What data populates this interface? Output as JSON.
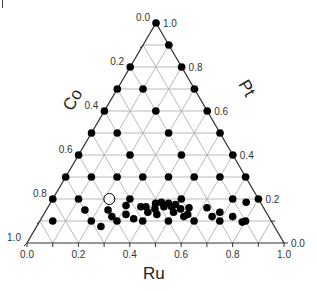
{
  "chart_data": {
    "type": "scatter",
    "subtype": "ternary",
    "title": "",
    "axes": {
      "bottom": {
        "label": "Ru",
        "ticks": [
          "0.0",
          "0.2",
          "0.4",
          "0.6",
          "0.8",
          "1.0"
        ]
      },
      "right": {
        "label": "Pt",
        "ticks": [
          "0.0",
          "0.2",
          "0.4",
          "0.6",
          "0.8",
          "1.0"
        ]
      },
      "left": {
        "label": "Co",
        "ticks": [
          "0.0",
          "0.2",
          "0.4",
          "0.6",
          "0.8",
          "1.0"
        ]
      }
    },
    "grid": true,
    "grid_step": 0.1,
    "series": [
      {
        "name": "filled",
        "marker": "filled-circle",
        "color": "#000000",
        "points": [
          {
            "Ru": 0.0,
            "Pt": 1.0,
            "Co": 0.0
          },
          {
            "Ru": 0.0,
            "Pt": 0.8,
            "Co": 0.2
          },
          {
            "Ru": 0.0,
            "Pt": 0.6,
            "Co": 0.4
          },
          {
            "Ru": 0.0,
            "Pt": 0.4,
            "Co": 0.6
          },
          {
            "Ru": 0.0,
            "Pt": 0.3,
            "Co": 0.7
          },
          {
            "Ru": 0.0,
            "Pt": 0.2,
            "Co": 0.8
          },
          {
            "Ru": 0.0,
            "Pt": 0.5,
            "Co": 0.5
          },
          {
            "Ru": 0.0,
            "Pt": 0.7,
            "Co": 0.3
          },
          {
            "Ru": 0.1,
            "Pt": 0.9,
            "Co": 0.0
          },
          {
            "Ru": 0.2,
            "Pt": 0.8,
            "Co": 0.0
          },
          {
            "Ru": 0.3,
            "Pt": 0.7,
            "Co": 0.0
          },
          {
            "Ru": 0.4,
            "Pt": 0.6,
            "Co": 0.0
          },
          {
            "Ru": 0.5,
            "Pt": 0.5,
            "Co": 0.0
          },
          {
            "Ru": 0.6,
            "Pt": 0.4,
            "Co": 0.0
          },
          {
            "Ru": 0.7,
            "Pt": 0.3,
            "Co": 0.0
          },
          {
            "Ru": 0.8,
            "Pt": 0.2,
            "Co": 0.0
          },
          {
            "Ru": 0.1,
            "Pt": 0.7,
            "Co": 0.2
          },
          {
            "Ru": 0.2,
            "Pt": 0.6,
            "Co": 0.2
          },
          {
            "Ru": 0.1,
            "Pt": 0.5,
            "Co": 0.4
          },
          {
            "Ru": 0.3,
            "Pt": 0.5,
            "Co": 0.2
          },
          {
            "Ru": 0.2,
            "Pt": 0.4,
            "Co": 0.4
          },
          {
            "Ru": 0.4,
            "Pt": 0.4,
            "Co": 0.2
          },
          {
            "Ru": 0.1,
            "Pt": 0.3,
            "Co": 0.6
          },
          {
            "Ru": 0.2,
            "Pt": 0.3,
            "Co": 0.5
          },
          {
            "Ru": 0.3,
            "Pt": 0.3,
            "Co": 0.4
          },
          {
            "Ru": 0.4,
            "Pt": 0.3,
            "Co": 0.3
          },
          {
            "Ru": 0.5,
            "Pt": 0.3,
            "Co": 0.2
          },
          {
            "Ru": 0.6,
            "Pt": 0.3,
            "Co": 0.1
          },
          {
            "Ru": 0.1,
            "Pt": 0.2,
            "Co": 0.7
          },
          {
            "Ru": 0.3,
            "Pt": 0.2,
            "Co": 0.5
          },
          {
            "Ru": 0.5,
            "Pt": 0.2,
            "Co": 0.3
          },
          {
            "Ru": 0.7,
            "Pt": 0.2,
            "Co": 0.1
          },
          {
            "Ru": 0.05,
            "Pt": 0.1,
            "Co": 0.85
          },
          {
            "Ru": 0.2,
            "Pt": 0.1,
            "Co": 0.7
          },
          {
            "Ru": 0.15,
            "Pt": 0.15,
            "Co": 0.7
          },
          {
            "Ru": 0.3,
            "Pt": 0.17,
            "Co": 0.53
          },
          {
            "Ru": 0.3,
            "Pt": 0.1,
            "Co": 0.6
          },
          {
            "Ru": 0.4,
            "Pt": 0.1,
            "Co": 0.5
          },
          {
            "Ru": 0.5,
            "Pt": 0.1,
            "Co": 0.4
          },
          {
            "Ru": 0.6,
            "Pt": 0.1,
            "Co": 0.3
          },
          {
            "Ru": 0.7,
            "Pt": 0.1,
            "Co": 0.2
          },
          {
            "Ru": 0.8,
            "Pt": 0.1,
            "Co": 0.1
          },
          {
            "Ru": 0.24,
            "Pt": 0.15,
            "Co": 0.61
          },
          {
            "Ru": 0.27,
            "Pt": 0.12,
            "Co": 0.61
          },
          {
            "Ru": 0.32,
            "Pt": 0.13,
            "Co": 0.55
          },
          {
            "Ru": 0.36,
            "Pt": 0.11,
            "Co": 0.53
          },
          {
            "Ru": 0.36,
            "Pt": 0.165,
            "Co": 0.475
          },
          {
            "Ru": 0.38,
            "Pt": 0.165,
            "Co": 0.455
          },
          {
            "Ru": 0.4,
            "Pt": 0.14,
            "Co": 0.46
          },
          {
            "Ru": 0.41,
            "Pt": 0.18,
            "Co": 0.41
          },
          {
            "Ru": 0.42,
            "Pt": 0.155,
            "Co": 0.425
          },
          {
            "Ru": 0.43,
            "Pt": 0.185,
            "Co": 0.385
          },
          {
            "Ru": 0.44,
            "Pt": 0.13,
            "Co": 0.43
          },
          {
            "Ru": 0.45,
            "Pt": 0.165,
            "Co": 0.385
          },
          {
            "Ru": 0.46,
            "Pt": 0.18,
            "Co": 0.36
          },
          {
            "Ru": 0.48,
            "Pt": 0.165,
            "Co": 0.355
          },
          {
            "Ru": 0.49,
            "Pt": 0.175,
            "Co": 0.335
          },
          {
            "Ru": 0.5,
            "Pt": 0.14,
            "Co": 0.36
          },
          {
            "Ru": 0.52,
            "Pt": 0.155,
            "Co": 0.325
          },
          {
            "Ru": 0.55,
            "Pt": 0.12,
            "Co": 0.33
          },
          {
            "Ru": 0.56,
            "Pt": 0.13,
            "Co": 0.31
          },
          {
            "Ru": 0.55,
            "Pt": 0.16,
            "Co": 0.29
          },
          {
            "Ru": 0.62,
            "Pt": 0.16,
            "Co": 0.22
          },
          {
            "Ru": 0.68,
            "Pt": 0.14,
            "Co": 0.18
          },
          {
            "Ru": 0.66,
            "Pt": 0.12,
            "Co": 0.22
          },
          {
            "Ru": 0.76,
            "Pt": 0.185,
            "Co": 0.055
          },
          {
            "Ru": 0.74,
            "Pt": 0.12,
            "Co": 0.14
          },
          {
            "Ru": 0.79,
            "Pt": 0.095,
            "Co": 0.115
          },
          {
            "Ru": 0.25,
            "Pt": 0.075,
            "Co": 0.675
          }
        ]
      },
      {
        "name": "open",
        "marker": "open-circle",
        "color": "#000000",
        "points": [
          {
            "Ru": 0.22,
            "Pt": 0.2,
            "Co": 0.58
          }
        ]
      }
    ]
  },
  "labels": {
    "ru_axis": "Ru",
    "pt_axis": "Pt",
    "co_axis": "Co",
    "bottom_ticks": [
      "0.0",
      "0.2",
      "0.4",
      "0.6",
      "0.8",
      "1.0"
    ],
    "right_ticks": [
      "0.0",
      "0.2",
      "0.4",
      "0.6",
      "0.8",
      "1.0"
    ],
    "left_ticks": [
      "1.0",
      "0.8",
      "0.6",
      "0.4",
      "0.2",
      "0.0"
    ]
  },
  "pixel_points": {
    "filled": [
      [
        156,
        24
      ],
      [
        143,
        47
      ],
      [
        130,
        71
      ],
      [
        117,
        94
      ],
      [
        104,
        118
      ],
      [
        91,
        141
      ],
      [
        117,
        94
      ],
      [
        104,
        118
      ],
      [
        169,
        47
      ],
      [
        182,
        71
      ],
      [
        195,
        94
      ],
      [
        208,
        118
      ],
      [
        221,
        141
      ],
      [
        234,
        165
      ],
      [
        247,
        188
      ],
      [
        259,
        210
      ],
      [
        150,
        82
      ],
      [
        155,
        103
      ],
      [
        108,
        127
      ],
      [
        181,
        125
      ],
      [
        124,
        150
      ],
      [
        175,
        150
      ],
      [
        88,
        166
      ],
      [
        119,
        166
      ],
      [
        151,
        166
      ],
      [
        165,
        166
      ],
      [
        201,
        166
      ],
      [
        220,
        166
      ],
      [
        71,
        186
      ],
      [
        103,
        186
      ],
      [
        132,
        186
      ],
      [
        191,
        186
      ],
      [
        217,
        186
      ],
      [
        249,
        186
      ],
      [
        145,
        186
      ],
      [
        63,
        207
      ],
      [
        80,
        219
      ],
      [
        114,
        219
      ],
      [
        142,
        219
      ],
      [
        90,
        229
      ],
      [
        152,
        207
      ],
      [
        178,
        208
      ],
      [
        211,
        212
      ],
      [
        63,
        241
      ],
      [
        88,
        242
      ],
      [
        117,
        242
      ],
      [
        146,
        242
      ],
      [
        174,
        242
      ],
      [
        202,
        242
      ],
      [
        234,
        242
      ],
      [
        259,
        242
      ]
    ]
  }
}
